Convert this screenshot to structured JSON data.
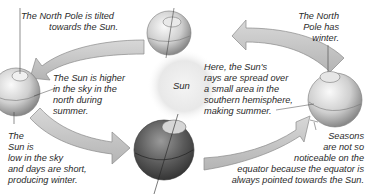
{
  "diagram": {
    "center": {
      "label": "Sun"
    },
    "labels": {
      "top_left": "The North Pole is tilted\n           towards the Sun.",
      "left_mid": "The Sun is higher\nin the sky in the\nnorth during\nsummer.",
      "bottom_left": "The\nSun is\nlow in the sky\nand days are short,\nproducing winter.",
      "top_right": "The North\nPole has\nwinter.",
      "right_mid": "Here, the Sun's\nrays are spread over\na small area in the\nsouthern hemisphere,\nmaking summer.",
      "bottom_right": "Seasons\nare not so\nnoticeable on the\nequator because the equator is\nalways pointed towards the Sun."
    },
    "colors": {
      "arrow_fill": "#c9c9c9",
      "arrow_stroke": "#8a8a8a",
      "sun_glow": "#e6e6e6",
      "earth_light": "#eeeeee",
      "earth_dark": "#555555"
    }
  }
}
